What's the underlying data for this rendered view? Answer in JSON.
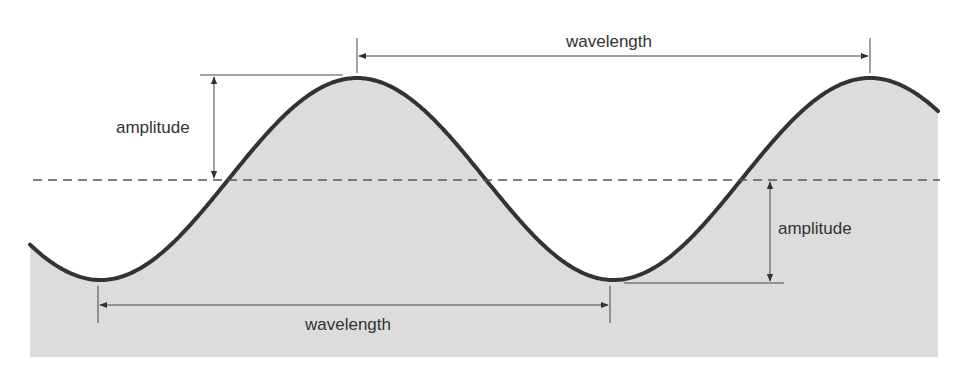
{
  "diagram": {
    "labels": {
      "wavelength_top": "wavelength",
      "wavelength_bottom": "wavelength",
      "amplitude_left": "amplitude",
      "amplitude_right": "amplitude"
    },
    "colors": {
      "fill": "#dcdcdc",
      "stroke": "#333333",
      "annotation": "#444444",
      "midline": "#555555",
      "background": "#ffffff"
    },
    "geometry": {
      "x_start": 30,
      "x_end": 938,
      "bottom": 357,
      "midline_y": 180,
      "crest_y": 78,
      "trough_y": 280,
      "crest_x": [
        357,
        870
      ],
      "trough_x": [
        98,
        610
      ]
    }
  }
}
